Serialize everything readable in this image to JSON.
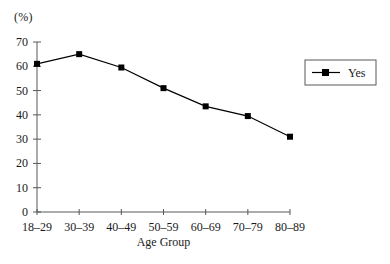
{
  "chart_data": {
    "type": "line",
    "title": "",
    "subtitle": "",
    "xlabel": "Age Group",
    "ylabel": "(%)",
    "categories": [
      "18–29",
      "30–39",
      "40–49",
      "50–59",
      "60–69",
      "70–79",
      "80–89"
    ],
    "series": [
      {
        "name": "Yes",
        "values": [
          61,
          65,
          59.5,
          51,
          43.5,
          39.5,
          31
        ],
        "color": "#000000",
        "marker": "square"
      }
    ],
    "ylim": [
      0,
      70
    ],
    "yticks": [
      0,
      10,
      20,
      30,
      40,
      50,
      60,
      70
    ],
    "ytick_labels": [
      "0",
      "10",
      "20",
      "30",
      "40",
      "50",
      "60",
      "70"
    ],
    "grid": false,
    "legend": {
      "position": "right",
      "entries": [
        "Yes"
      ],
      "bordered": true
    }
  },
  "axis": {
    "y_unit_label": "(%)",
    "x_title": "Age Group"
  },
  "legend": {
    "label": "Yes"
  }
}
